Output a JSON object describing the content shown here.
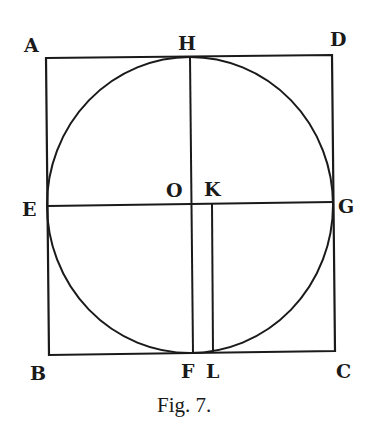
{
  "figure": {
    "caption": "Fig. 7.",
    "colors": {
      "ink": "#1a1a1a",
      "paper": "#ffffff"
    },
    "square": {
      "vertices": {
        "A": [
          46,
          58
        ],
        "D": [
          332,
          55
        ],
        "C": [
          335,
          351
        ],
        "B": [
          49,
          355
        ]
      }
    },
    "circle": {
      "center": "O",
      "cx": 190,
      "cy": 205,
      "r": 144
    },
    "segments": [
      {
        "name": "diameter-EG",
        "from": "E",
        "to": "G",
        "x1": 48,
        "y1": 206,
        "x2": 333,
        "y2": 202
      },
      {
        "name": "diameter-HF",
        "from": "H",
        "to": "F",
        "x1": 190,
        "y1": 57,
        "x2": 193,
        "y2": 353
      },
      {
        "name": "segment-KL",
        "from": "K",
        "to": "L",
        "x1": 212,
        "y1": 204,
        "x2": 213,
        "y2": 352
      }
    ],
    "labels": [
      {
        "id": "A",
        "text": "A",
        "x": 24,
        "y": 52
      },
      {
        "id": "H",
        "text": "H",
        "x": 178,
        "y": 50
      },
      {
        "id": "D",
        "text": "D",
        "x": 330,
        "y": 46
      },
      {
        "id": "E",
        "text": "E",
        "x": 22,
        "y": 216
      },
      {
        "id": "O",
        "text": "O",
        "x": 166,
        "y": 197
      },
      {
        "id": "K",
        "text": "K",
        "x": 204,
        "y": 196
      },
      {
        "id": "G",
        "text": "G",
        "x": 338,
        "y": 213
      },
      {
        "id": "B",
        "text": "B",
        "x": 30,
        "y": 380
      },
      {
        "id": "F",
        "text": "F",
        "x": 181,
        "y": 378
      },
      {
        "id": "L",
        "text": "L",
        "x": 206,
        "y": 378
      },
      {
        "id": "C",
        "text": "C",
        "x": 336,
        "y": 378
      }
    ]
  }
}
